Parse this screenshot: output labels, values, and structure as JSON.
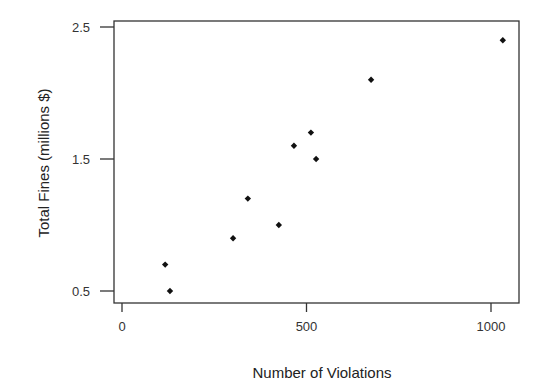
{
  "chart_data": {
    "type": "scatter",
    "title": "",
    "xlabel": "Number of Violations",
    "ylabel": "Total Fines (millions $)",
    "xlim": [
      -20,
      1060
    ],
    "ylim": [
      0.41,
      2.54
    ],
    "xticks": [
      0,
      500,
      1000
    ],
    "xtick_labels": [
      "0",
      "500",
      "1000"
    ],
    "yticks": [
      0.5,
      1.5,
      2.5
    ],
    "ytick_labels": [
      "0.5",
      "1.5",
      "2.5"
    ],
    "grid": false,
    "legend": null,
    "marker": "diamond",
    "marker_color": "#111111",
    "points": [
      {
        "x": 117,
        "y": 0.7
      },
      {
        "x": 130,
        "y": 0.5
      },
      {
        "x": 301,
        "y": 0.9
      },
      {
        "x": 341,
        "y": 1.2
      },
      {
        "x": 425,
        "y": 1.0
      },
      {
        "x": 466,
        "y": 1.6
      },
      {
        "x": 512,
        "y": 1.7
      },
      {
        "x": 526,
        "y": 1.5
      },
      {
        "x": 675,
        "y": 2.1
      },
      {
        "x": 1032,
        "y": 2.4
      }
    ]
  },
  "layout": {
    "frame": {
      "left": 114,
      "top": 21,
      "right": 519,
      "bottom": 303
    },
    "x_px_at_0": 122,
    "x_px_per_unit": 0.369,
    "y_px_at_0_5": 291,
    "y_px_per_unit": 132
  }
}
